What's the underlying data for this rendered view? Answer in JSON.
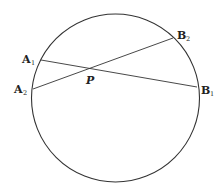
{
  "diagram": {
    "type": "intersecting-chords",
    "stroke_color": "#333333",
    "circle": {
      "cx": 115.5,
      "cy": 98,
      "r": 84
    },
    "chords": [
      {
        "name": "A1B1",
        "x1": 41,
        "y1": 60,
        "x2": 197,
        "y2": 87
      },
      {
        "name": "A2B2",
        "x1": 33,
        "y1": 89,
        "x2": 173,
        "y2": 38
      }
    ],
    "labels": {
      "A1": {
        "main": "A",
        "sub": "1"
      },
      "A2": {
        "main": "A",
        "sub": "2"
      },
      "B1": {
        "main": "B",
        "sub": "1"
      },
      "B2": {
        "main": "B",
        "sub": "2"
      },
      "P": {
        "main": "P"
      }
    }
  }
}
